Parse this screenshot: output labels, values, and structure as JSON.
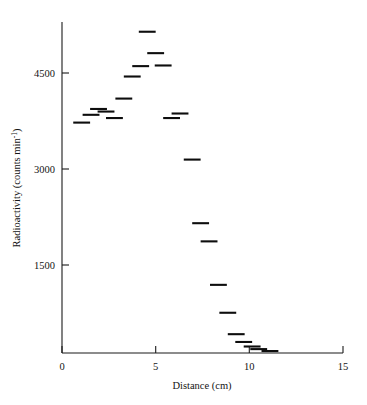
{
  "chart_data": {
    "type": "scatter",
    "title": "",
    "xlabel": "Distance (cm)",
    "ylabel": "Radioactivity (counts min",
    "ylabel_exponent": "-1",
    "ylabel_suffix": ")",
    "xlim": [
      0,
      15
    ],
    "ylim": [
      0,
      5100
    ],
    "xticks": [
      0,
      5,
      10,
      15
    ],
    "xticklabels": [
      "0",
      "5",
      "10",
      "15"
    ],
    "yticks": [
      1500,
      3000,
      4500
    ],
    "yticklabels": [
      "1500",
      "3000",
      "4500"
    ],
    "grid": false,
    "legend": false,
    "marker_style": "horizontal-dash",
    "marker_width_cm": 0.45,
    "x": [
      1.05,
      1.55,
      1.95,
      2.35,
      2.8,
      3.3,
      3.75,
      4.2,
      4.55,
      5.0,
      5.4,
      5.85,
      6.3,
      6.95,
      7.4,
      7.85,
      8.35,
      8.85,
      9.3,
      9.7,
      10.15,
      10.5,
      11.1
    ],
    "values": [
      3550,
      3670,
      3760,
      3720,
      3620,
      3920,
      4260,
      4420,
      4950,
      4620,
      4430,
      3620,
      3690,
      2980,
      2000,
      1720,
      1050,
      620,
      290,
      170,
      100,
      60,
      30
    ],
    "series": [
      {
        "name": "Radioactivity profile",
        "points": [
          {
            "x": 1.05,
            "y": 3550
          },
          {
            "x": 1.55,
            "y": 3670
          },
          {
            "x": 1.95,
            "y": 3760
          },
          {
            "x": 2.35,
            "y": 3720
          },
          {
            "x": 2.8,
            "y": 3620
          },
          {
            "x": 3.3,
            "y": 3920
          },
          {
            "x": 3.75,
            "y": 4260
          },
          {
            "x": 4.2,
            "y": 4420
          },
          {
            "x": 4.55,
            "y": 4950
          },
          {
            "x": 5.0,
            "y": 4620
          },
          {
            "x": 5.4,
            "y": 4430
          },
          {
            "x": 5.85,
            "y": 3620
          },
          {
            "x": 6.3,
            "y": 3690
          },
          {
            "x": 6.95,
            "y": 2980
          },
          {
            "x": 7.4,
            "y": 2000
          },
          {
            "x": 7.85,
            "y": 1720
          },
          {
            "x": 8.35,
            "y": 1050
          },
          {
            "x": 8.85,
            "y": 620
          },
          {
            "x": 9.3,
            "y": 290
          },
          {
            "x": 9.7,
            "y": 170
          },
          {
            "x": 10.15,
            "y": 100
          },
          {
            "x": 10.5,
            "y": 60
          },
          {
            "x": 11.1,
            "y": 30
          }
        ]
      }
    ],
    "colors": {
      "marker": "#0d0d0d",
      "axis": "#1a1a1a",
      "background": "#ffffff"
    }
  }
}
